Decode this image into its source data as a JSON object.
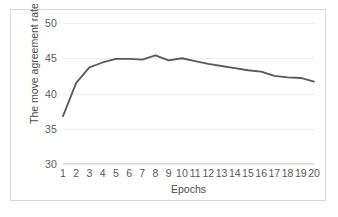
{
  "chart_data": {
    "type": "line",
    "title": "",
    "xlabel": "Epochs",
    "ylabel": "The move agreement rate (%)",
    "x": [
      1,
      2,
      3,
      4,
      5,
      6,
      7,
      8,
      9,
      10,
      11,
      12,
      13,
      14,
      15,
      16,
      17,
      18,
      19,
      20
    ],
    "xticklabels": [
      "1",
      "2",
      "3",
      "4",
      "5",
      "6",
      "7",
      "8",
      "9",
      "10",
      "11",
      "12",
      "13",
      "14",
      "15",
      "16",
      "17",
      "18",
      "19",
      "20"
    ],
    "yticklabels": [
      "30",
      "35",
      "40",
      "45",
      "50"
    ],
    "yticks": [
      30,
      35,
      40,
      45,
      50
    ],
    "ylim": [
      30,
      50
    ],
    "xlim": [
      1,
      20
    ],
    "grid": true,
    "legend": null,
    "series": [
      {
        "name": "move agreement rate",
        "color": "#595959",
        "values": [
          36.8,
          41.5,
          43.7,
          44.4,
          44.9,
          44.9,
          44.8,
          45.4,
          44.7,
          45.0,
          44.6,
          44.2,
          43.9,
          43.6,
          43.3,
          43.1,
          42.5,
          42.3,
          42.2,
          41.7
        ]
      }
    ]
  },
  "style": {
    "line_color": "#595959",
    "grid_color": "#ededed",
    "axis_color": "#d6d6d6",
    "border_color": "#d9d9d9",
    "tick_text_color": "#595959",
    "label_text_color": "#4a4a4a",
    "background": "#ffffff"
  }
}
